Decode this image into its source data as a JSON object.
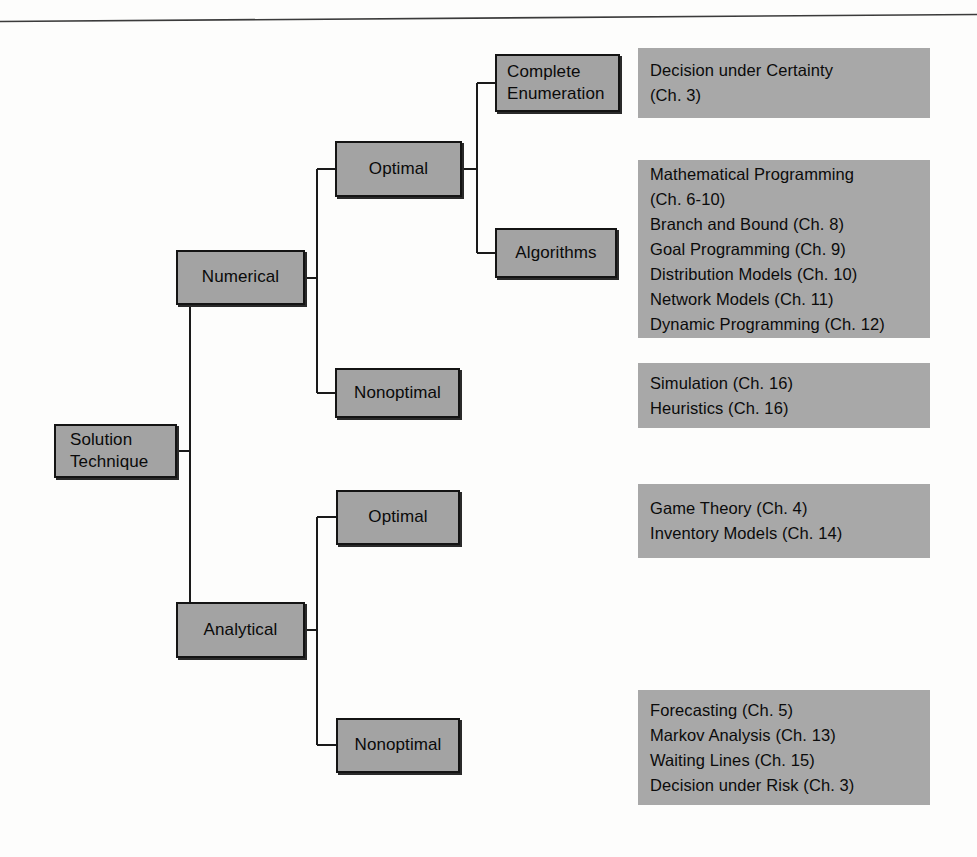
{
  "diagram": {
    "colors": {
      "node_fill": "#a3a3a3",
      "node_border": "#141414",
      "panel_fill": "#a8a8a8",
      "line": "#1a1a1a",
      "background": "#fdfdfc"
    },
    "root": {
      "label_line1": "Solution",
      "label_line2": "Technique"
    },
    "nodes": [
      {
        "id": "numerical",
        "label": "Numerical"
      },
      {
        "id": "analytical",
        "label": "Analytical"
      },
      {
        "id": "numerical-optimal",
        "label": "Optimal"
      },
      {
        "id": "numerical-nonoptimal",
        "label": "Nonoptimal"
      },
      {
        "id": "complete-enumeration",
        "label_line1": "Complete",
        "label_line2": "Enumeration"
      },
      {
        "id": "algorithms",
        "label": "Algorithms"
      },
      {
        "id": "analytical-optimal",
        "label": "Optimal"
      },
      {
        "id": "analytical-nonoptimal",
        "label": "Nonoptimal"
      }
    ],
    "panels": [
      {
        "id": "panel-complete-enumeration",
        "lines": [
          "Decision under Certainty",
          "(Ch. 3)"
        ]
      },
      {
        "id": "panel-algorithms",
        "lines": [
          "Mathematical Programming",
          "(Ch. 6-10)",
          "Branch and Bound (Ch. 8)",
          "Goal Programming (Ch. 9)",
          "Distribution Models (Ch. 10)",
          "Network Models (Ch. 11)",
          "Dynamic Programming (Ch. 12)"
        ]
      },
      {
        "id": "panel-numerical-nonoptimal",
        "lines": [
          "Simulation (Ch. 16)",
          "Heuristics (Ch. 16)"
        ]
      },
      {
        "id": "panel-analytical-optimal",
        "lines": [
          "Game Theory (Ch. 4)",
          "Inventory Models (Ch. 14)"
        ]
      },
      {
        "id": "panel-analytical-nonoptimal",
        "lines": [
          "Forecasting (Ch. 5)",
          "Markov Analysis (Ch. 13)",
          "Waiting Lines (Ch. 15)",
          "Decision under Risk (Ch. 3)"
        ]
      }
    ]
  }
}
